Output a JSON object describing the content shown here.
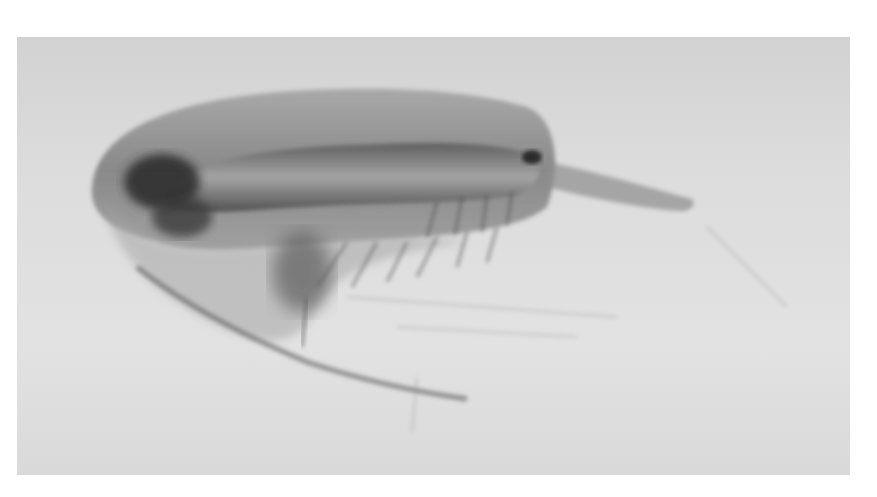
{
  "image": {
    "subject": "copepod-microscope-photograph",
    "alt": "Grayscale micrograph of a copepod crustacean in lateral view",
    "colors": {
      "page_background": "#ffffff",
      "photo_background": "#dcdcdc",
      "body_dark": "#3a3a3a",
      "body_mid": "#8a8a8a",
      "body_light": "#bdbdbd"
    }
  }
}
